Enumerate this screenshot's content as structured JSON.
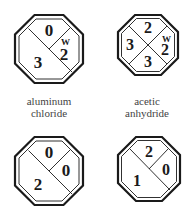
{
  "figure": {
    "colors": {
      "stroke": "#1a1a1a",
      "text": "#1a1a1a",
      "label": "#444444",
      "background": "#ffffff"
    },
    "signs": [
      {
        "name": "aluminum chloride",
        "label_line1": "aluminum",
        "label_line2": "chloride",
        "layout": "diagonal-3",
        "top": "0",
        "right": "2",
        "left": "3",
        "special": "W"
      },
      {
        "name": "acetic anhydride",
        "label_line1": "acetic",
        "label_line2": "anhydride",
        "layout": "cross-4",
        "top": "2",
        "right": "2",
        "left": "3",
        "bottom": "3",
        "special": "W"
      },
      {
        "name": "",
        "layout": "diagonal-3",
        "top": "0",
        "right": "0",
        "left": "2",
        "special": ""
      },
      {
        "name": "",
        "layout": "diagonal-3",
        "top": "2",
        "right": "0",
        "left": "1",
        "special": ""
      }
    ]
  }
}
